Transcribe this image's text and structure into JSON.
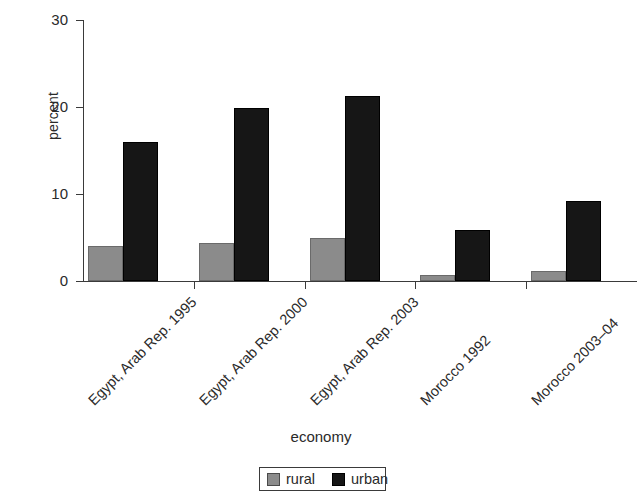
{
  "chart_data": {
    "type": "bar",
    "title": "",
    "subtitle": "",
    "xlabel": "economy",
    "ylabel": "percent",
    "ylim": [
      0,
      30
    ],
    "yticks": [
      0,
      10,
      20,
      30
    ],
    "ytick_labels": [
      "0",
      "10",
      "20",
      "30"
    ],
    "grid": false,
    "legend_position": "bottom-center",
    "categories": [
      "Egypt, Arab Rep. 1995",
      "Egypt, Arab Rep. 2000",
      "Egypt, Arab Rep. 2003",
      "Morocco 1992",
      "Morocco 2003–04"
    ],
    "series": [
      {
        "name": "rural",
        "color": "#8b8b8b",
        "values": [
          4.0,
          4.4,
          5.0,
          0.7,
          1.1
        ]
      },
      {
        "name": "urban",
        "color": "#161616",
        "values": [
          16.0,
          19.9,
          21.3,
          5.9,
          9.2
        ]
      }
    ]
  },
  "legend": {
    "entries": [
      {
        "label": "rural",
        "swatch": "rural"
      },
      {
        "label": "urban",
        "swatch": "urban"
      }
    ]
  }
}
